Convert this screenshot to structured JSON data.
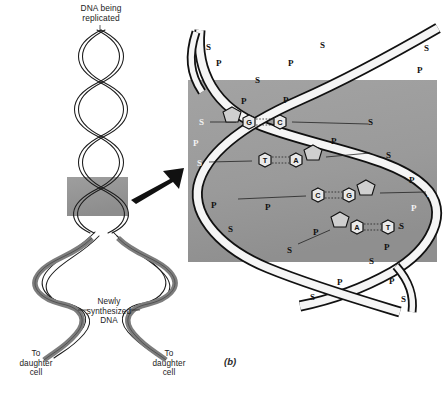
{
  "figure": {
    "letter": "(b)",
    "background": "#ffffff",
    "panel_color": "#9a9a9a",
    "ink_color": "#111111",
    "strand_old_color": "#f7f7f7",
    "strand_new_color": "#8c8c8c"
  },
  "labels": {
    "title": "DNA being\nreplicated",
    "newly_synthesized": "Newly\nsynthesized\nDNA",
    "daughter_left": "To\ndaughter\ncell",
    "daughter_right": "To\ndaughter\ncell"
  },
  "backbone": {
    "sugar_symbol": "S",
    "phosphate_symbol": "P",
    "left_sequence": [
      "S",
      "P",
      "S",
      "P",
      "S"
    ],
    "right_sequence": [
      "S",
      "P",
      "S",
      "P",
      "S"
    ]
  },
  "base_pairs": [
    {
      "left": "G",
      "right": "C",
      "left_has_sugar": true,
      "right_has_sugar": false
    },
    {
      "left": "T",
      "right": "A",
      "left_has_sugar": false,
      "right_has_sugar": true
    },
    {
      "left": "C",
      "right": "G",
      "left_has_sugar": false,
      "right_has_sugar": true
    },
    {
      "left": "A",
      "right": "T",
      "left_has_sugar": true,
      "right_has_sugar": false
    }
  ],
  "backbone_marks_upper": [
    {
      "t": "S",
      "x": 206,
      "y": 47,
      "white": false
    },
    {
      "t": "P",
      "x": 216,
      "y": 63,
      "white": false
    },
    {
      "t": "S",
      "x": 255,
      "y": 80,
      "white": false
    },
    {
      "t": "P",
      "x": 241,
      "y": 101,
      "white": false
    },
    {
      "t": "S",
      "x": 320,
      "y": 45,
      "white": false
    },
    {
      "t": "P",
      "x": 288,
      "y": 63,
      "white": false
    },
    {
      "t": "P",
      "x": 283,
      "y": 100,
      "white": false
    },
    {
      "t": "S",
      "x": 424,
      "y": 48,
      "white": false
    },
    {
      "t": "P",
      "x": 417,
      "y": 70,
      "white": false
    }
  ],
  "backbone_marks_panel": [
    {
      "t": "S",
      "x": 205,
      "y": 122,
      "white": true
    },
    {
      "t": "P",
      "x": 198,
      "y": 143,
      "white": true
    },
    {
      "t": "S",
      "x": 203,
      "y": 163,
      "white": true
    },
    {
      "t": "P",
      "x": 214,
      "y": 205,
      "white": false
    },
    {
      "t": "S",
      "x": 231,
      "y": 229,
      "white": false
    },
    {
      "t": "P",
      "x": 268,
      "y": 207,
      "white": false
    },
    {
      "t": "P",
      "x": 334,
      "y": 141,
      "white": false
    },
    {
      "t": "S",
      "x": 371,
      "y": 122,
      "white": false
    },
    {
      "t": "S",
      "x": 389,
      "y": 155,
      "white": false
    },
    {
      "t": "P",
      "x": 412,
      "y": 180,
      "white": false
    },
    {
      "t": "S",
      "x": 430,
      "y": 194,
      "white": true
    },
    {
      "t": "P",
      "x": 414,
      "y": 208,
      "white": true
    },
    {
      "t": "S",
      "x": 402,
      "y": 226,
      "white": false
    },
    {
      "t": "P",
      "x": 387,
      "y": 247,
      "white": false
    },
    {
      "t": "S",
      "x": 290,
      "y": 250,
      "white": false
    },
    {
      "t": "P",
      "x": 316,
      "y": 232,
      "white": false
    }
  ],
  "backbone_marks_lower": [
    {
      "t": "S",
      "x": 372,
      "y": 261,
      "white": false
    },
    {
      "t": "P",
      "x": 340,
      "y": 282,
      "white": false
    },
    {
      "t": "S",
      "x": 313,
      "y": 297,
      "white": false
    },
    {
      "t": "P",
      "x": 392,
      "y": 281,
      "white": false
    },
    {
      "t": "S",
      "x": 404,
      "y": 299,
      "white": false
    }
  ],
  "base_pair_positions": [
    {
      "lx": 249,
      "ly": 122,
      "rx": 280,
      "ry": 122,
      "sugar_x": 232,
      "sugar_y": 114,
      "tick_l": 207,
      "tick_r": 372
    },
    {
      "lx": 265,
      "ly": 160,
      "rx": 296,
      "ry": 160,
      "sugar_x": 313,
      "sugar_y": 152,
      "tick_l": 205,
      "tick_r": 374
    },
    {
      "lx": 318,
      "ly": 195,
      "rx": 349,
      "ry": 195,
      "sugar_x": 366,
      "sugar_y": 187,
      "tick_l": 233,
      "tick_r": 430
    },
    {
      "lx": 357,
      "ly": 227,
      "rx": 388,
      "ry": 227,
      "sugar_x": 340,
      "sugar_y": 219,
      "tick_l": 293,
      "tick_r": 404
    }
  ]
}
